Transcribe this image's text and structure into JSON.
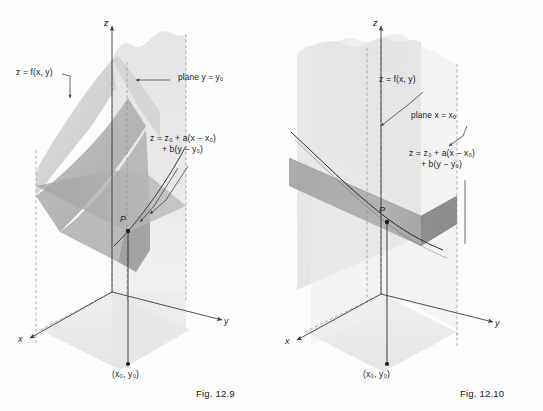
{
  "document": {
    "type": "textbook-figure-pair",
    "description": "Two three-dimensional coordinate diagrams illustrating the tangent plane to a surface z = f(x, y) at the point P, cut by the vertical planes y = y0 and x = x0."
  },
  "figures": [
    {
      "id": "fig-12-9",
      "caption": "Fig. 12.9",
      "axes": {
        "x": "x",
        "y": "y",
        "z": "z"
      },
      "point_label": "P",
      "base_point_label": "(x₀, y₀)",
      "labels": {
        "surface": "z = f(x, y)",
        "cutting_plane": "plane  y = y₀",
        "tangent_plane_line1": "z = z₀ + a(x − x₀)",
        "tangent_plane_line2": "+ b(y − y₀)"
      }
    },
    {
      "id": "fig-12-10",
      "caption": "Fig. 12.10",
      "axes": {
        "x": "x",
        "y": "y",
        "z": "z"
      },
      "point_label": "P",
      "base_point_label": "(x₀, y₀)",
      "labels": {
        "surface": "z = f(x, y)",
        "cutting_plane": "plane  x = x₀",
        "tangent_plane_line1": "z = z₀ + a(x − x₀)",
        "tangent_plane_line2": "+ b(y − y₀)"
      }
    }
  ],
  "colors": {
    "background": "#fdfdfd",
    "ink": "#232323",
    "axis": "#4a4a4a",
    "surface_light": "#dcdcdc",
    "surface_mid": "#c4c4c4",
    "surface_dark": "#a8a8a8",
    "tangent_plane": "#9a9a9a",
    "cutting_plane": "#e4e4e4",
    "floor": "#e8e8e8"
  }
}
